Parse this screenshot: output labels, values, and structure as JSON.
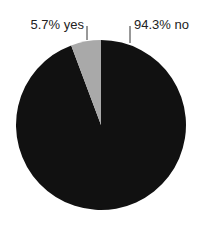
{
  "chart_data": {
    "type": "pie",
    "title": "",
    "categories": [
      "yes",
      "no"
    ],
    "values": [
      5.7,
      94.3
    ],
    "labels": [
      "5.7% yes",
      "94.3% no"
    ],
    "colors": [
      "#a9a9a9",
      "#111111"
    ],
    "legend": "none"
  }
}
